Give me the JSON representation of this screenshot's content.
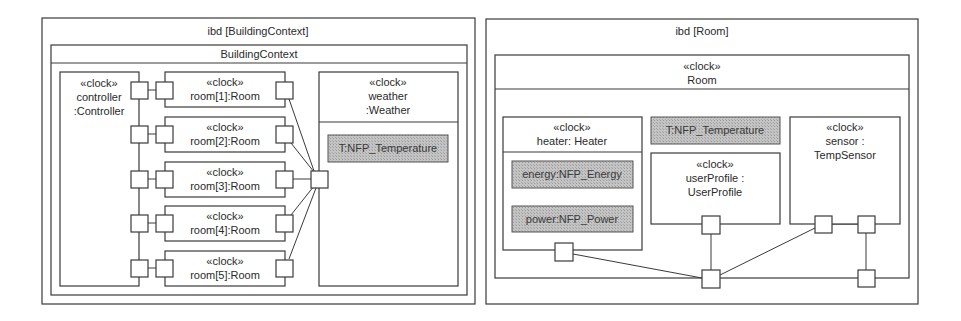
{
  "left_diagram": {
    "frame_title": "ibd [BuildingContext]",
    "block_name": "BuildingContext",
    "controller": {
      "stereotype": "«clock»",
      "name_line1": "controller",
      "name_line2": ":Controller"
    },
    "rooms": [
      {
        "stereotype": "«clock»",
        "name": "room[1]:Room"
      },
      {
        "stereotype": "«clock»",
        "name": "room[2]:Room"
      },
      {
        "stereotype": "«clock»",
        "name": "room[3]:Room"
      },
      {
        "stereotype": "«clock»",
        "name": "room[4]:Room"
      },
      {
        "stereotype": "«clock»",
        "name": "room[5]:Room"
      }
    ],
    "weather": {
      "stereotype": "«clock»",
      "name_line1": "weather",
      "name_line2": ":Weather",
      "property": "T:NFP_Temperature"
    }
  },
  "right_diagram": {
    "frame_title": "ibd [Room]",
    "block_stereotype": "«clock»",
    "block_name": "Room",
    "heater": {
      "stereotype": "«clock»",
      "name": "heater: Heater",
      "properties": [
        "energy:NFP_Energy",
        "power:NFP_Power"
      ]
    },
    "temperature_property": "T:NFP_Temperature",
    "user_profile": {
      "stereotype": "«clock»",
      "name_line1": "userProfile :",
      "name_line2": "UserProfile"
    },
    "sensor": {
      "stereotype": "«clock»",
      "name_line1": "sensor :",
      "name_line2": "TempSensor"
    }
  },
  "colors": {
    "line": "#3a3a3a",
    "property_fill": "#b8b8b8",
    "background": "#ffffff"
  }
}
